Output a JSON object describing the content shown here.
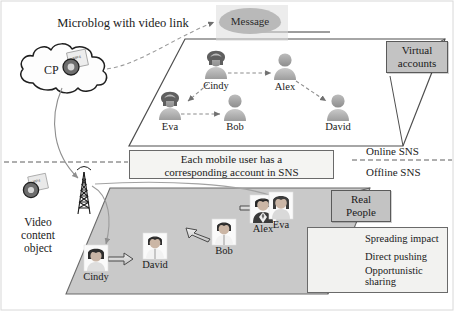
{
  "figure": {
    "type": "architecture-diagram",
    "caption_title": "Microblog with video link"
  },
  "cloud": {
    "label": "CP",
    "icon": "video-media-icon"
  },
  "video_object": {
    "label": "Video\ncontent\nobject",
    "line1": "Video",
    "line2": "content",
    "line3": "object",
    "icon": "video-media-icon"
  },
  "antenna": {
    "icon": "cell-tower-icon"
  },
  "message": {
    "label": "Message"
  },
  "layers": {
    "online": {
      "side_label": "Online SNS",
      "badge": {
        "line1": "Virtual",
        "line2": "accounts"
      },
      "note": {
        "line1": "Each mobile user has a",
        "line2": "corresponding account in SNS"
      }
    },
    "offline": {
      "side_label": "Offline SNS",
      "badge": {
        "line1": "Real",
        "line2": "People"
      }
    }
  },
  "virtual_nodes": [
    {
      "id": "cindy",
      "name": "Cindy",
      "avatar": "female-silhouette-icon"
    },
    {
      "id": "alex",
      "name": "Alex",
      "avatar": "male-silhouette-icon"
    },
    {
      "id": "eva",
      "name": "Eva",
      "avatar": "female-silhouette-icon"
    },
    {
      "id": "bob",
      "name": "Bob",
      "avatar": "male-silhouette-icon"
    },
    {
      "id": "david",
      "name": "David",
      "avatar": "male-silhouette-icon"
    }
  ],
  "real_nodes": [
    {
      "id": "cindy",
      "name": "Cindy",
      "avatar": "female-photo-icon"
    },
    {
      "id": "david",
      "name": "David",
      "avatar": "male-photo-icon"
    },
    {
      "id": "bob",
      "name": "Bob",
      "avatar": "male-photo-icon"
    },
    {
      "id": "alex",
      "name": "Alex",
      "avatar": "male-photo-suit-icon"
    },
    {
      "id": "eva",
      "name": "Eva",
      "avatar": "female-photo-icon"
    }
  ],
  "legend": [
    {
      "style": "dashed-arrow",
      "label": "Spreading impact"
    },
    {
      "style": "solid-arrow",
      "label": "Direct pushing"
    },
    {
      "style": "block-arrow",
      "label": "Opportunistic sharing",
      "line1": "Opportunistic",
      "line2": "sharing"
    }
  ],
  "edges_virtual": [
    {
      "from": "cindy",
      "to": "alex",
      "style": "dashed-arrow"
    },
    {
      "from": "cindy",
      "to": "eva",
      "style": "dashed-arrow"
    },
    {
      "from": "eva",
      "to": "bob",
      "style": "dashed-arrow"
    },
    {
      "from": "alex",
      "to": "david",
      "style": "dashed-arrow"
    }
  ],
  "edges_real": [
    {
      "from": "cindy",
      "to": "david",
      "style": "block-arrow"
    },
    {
      "from": "alex",
      "to": "bob",
      "style": "block-arrow"
    },
    {
      "from": "alex",
      "to": "eva",
      "style": "block-arrow"
    }
  ],
  "colors": {
    "badge_fill": "#c3c3c3",
    "badge_border": "#5a5a5a",
    "offline_plane": "#c9c9c9",
    "online_plane": "#ffffff",
    "line": "#6e6e6e",
    "text": "#1b1b1b"
  }
}
